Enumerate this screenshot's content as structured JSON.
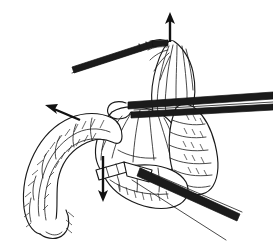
{
  "figure": {
    "title": "Surgical line illustration: bowel and mesentery retraction",
    "domain_note": "black and white pen-and-ink medical illustration",
    "width": 273,
    "height": 252,
    "background_color": "#ffffff",
    "ink_color": "#1a1a1a",
    "instrument_color": "#1b1b1b",
    "arrow_color": "#111111",
    "has_text_labels": false,
    "caption": ""
  },
  "anatomy": {
    "structures": [
      {
        "name": "elevated-tissue-bundle",
        "label": "Tented tissue grasped by forceps",
        "position": "top-center",
        "texture": "vertical fold lines"
      },
      {
        "name": "mesentery-fan",
        "label": "Mesenteric fan",
        "position": "center",
        "texture": "radiating fan lines"
      },
      {
        "name": "bowel-loop-right",
        "label": "Vertical segmented bowel limb",
        "position": "right",
        "texture": "transverse segment hatching"
      },
      {
        "name": "bowel-loop-left",
        "label": "Coiled bowel loop descending left",
        "position": "left",
        "texture": "hatched haustral coils"
      },
      {
        "name": "bowel-loop-bottom",
        "label": "Lower bowel segment",
        "position": "bottom-center",
        "texture": "short hatch strokes"
      }
    ]
  },
  "instruments": [
    {
      "name": "forceps-upper-left",
      "label": "Grasping forceps",
      "orientation": "diagonal from upper-left to tissue apex",
      "tip": "jaw grasping tented tissue"
    },
    {
      "name": "retractor-horizontal",
      "label": "Hooked retractor rod",
      "orientation": "horizontal across mid-field to right edge",
      "tip": "rounded hook / loop tip at left"
    },
    {
      "name": "clamp-lower-right",
      "label": "Clamp shaft",
      "orientation": "diagonal from center to lower-right corner",
      "tip": "banded collar segment"
    }
  ],
  "arrows": [
    {
      "name": "arrow-up",
      "label": "Upward traction",
      "direction": "up",
      "x": 170,
      "y_from": 42,
      "y_to": 14
    },
    {
      "name": "arrow-left",
      "label": "Leftward traction",
      "direction": "up-left",
      "x_from": 80,
      "y_from": 120,
      "x_to": 46,
      "y_to": 106
    },
    {
      "name": "arrow-down",
      "label": "Downward traction",
      "direction": "down",
      "x": 103,
      "y_from": 156,
      "y_to": 202
    }
  ]
}
